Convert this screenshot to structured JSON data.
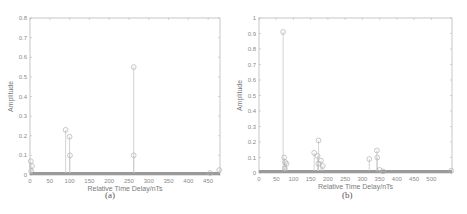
{
  "chart_data": [
    {
      "type": "stem",
      "panel": "a",
      "caption": "(a)",
      "title": "",
      "xlabel": "Relative Time Delay/nTs",
      "ylabel": "Amplitude",
      "xlim": [
        0,
        480
      ],
      "ylim": [
        0,
        0.8
      ],
      "xticks": [
        0,
        50,
        100,
        150,
        200,
        250,
        300,
        350,
        400,
        450
      ],
      "yticks": [
        0,
        0.1,
        0.2,
        0.3,
        0.4,
        0.5,
        0.6,
        0.7,
        0.8
      ],
      "grid": false,
      "color": "#c8c8c8",
      "points": [
        {
          "x": 2,
          "y": 0.07
        },
        {
          "x": 5,
          "y": 0.045
        },
        {
          "x": 3,
          "y": 0.02
        },
        {
          "x": 90,
          "y": 0.23
        },
        {
          "x": 100,
          "y": 0.195
        },
        {
          "x": 101,
          "y": 0.1
        },
        {
          "x": 262,
          "y": 0.55
        },
        {
          "x": 262,
          "y": 0.1
        },
        {
          "x": 455,
          "y": 0.01
        },
        {
          "x": 478,
          "y": 0.025
        }
      ]
    },
    {
      "type": "stem",
      "panel": "b",
      "caption": "(b)",
      "title": "",
      "xlabel": "Relative Time Delay/nTs",
      "ylabel": "Amplitude",
      "xlim": [
        0,
        560
      ],
      "ylim": [
        0,
        1
      ],
      "xticks": [
        0,
        50,
        100,
        150,
        200,
        250,
        300,
        350,
        400,
        450,
        500
      ],
      "yticks": [
        0,
        0.1,
        0.2,
        0.3,
        0.4,
        0.5,
        0.6,
        0.7,
        0.8,
        0.9,
        1
      ],
      "grid": false,
      "color": "#c8c8c8",
      "points": [
        {
          "x": 70,
          "y": 0.91
        },
        {
          "x": 73,
          "y": 0.1
        },
        {
          "x": 76,
          "y": 0.07
        },
        {
          "x": 80,
          "y": 0.06
        },
        {
          "x": 75,
          "y": 0.03
        },
        {
          "x": 160,
          "y": 0.13
        },
        {
          "x": 170,
          "y": 0.11
        },
        {
          "x": 173,
          "y": 0.21
        },
        {
          "x": 180,
          "y": 0.08
        },
        {
          "x": 185,
          "y": 0.045
        },
        {
          "x": 172,
          "y": 0.06
        },
        {
          "x": 320,
          "y": 0.09
        },
        {
          "x": 342,
          "y": 0.145
        },
        {
          "x": 343,
          "y": 0.1
        },
        {
          "x": 350,
          "y": 0.02
        },
        {
          "x": 360,
          "y": 0.01
        },
        {
          "x": 558,
          "y": 0.015
        }
      ]
    }
  ]
}
